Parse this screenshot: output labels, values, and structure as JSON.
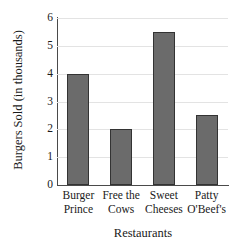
{
  "chart_data": {
    "type": "bar",
    "title": "",
    "xlabel": "Restaurants",
    "ylabel": "Burgers Sold (in thousands)",
    "categories": [
      "Burger Prince",
      "Free the Cows",
      "Sweet Cheeses",
      "Patty O'Beef's"
    ],
    "category_lines": [
      [
        "Burger",
        "Prince"
      ],
      [
        "Free the",
        "Cows"
      ],
      [
        "Sweet",
        "Cheeses"
      ],
      [
        "Patty",
        "O'Beef's"
      ]
    ],
    "values": [
      4,
      2,
      5.5,
      2.5
    ],
    "ylim": [
      0,
      6
    ],
    "ytick_values": [
      6,
      5,
      4,
      3,
      2,
      1,
      0
    ],
    "ytick_labels": [
      "6",
      "5",
      "4",
      "3",
      "2",
      "1",
      "0"
    ],
    "grid": true,
    "grid_axis": "y",
    "legend": "none",
    "bar_color": "#6b6b6b",
    "bar_border_color": "#333333",
    "grid_color": "#e3e3e3",
    "axis_color": "#4a4a4a"
  }
}
